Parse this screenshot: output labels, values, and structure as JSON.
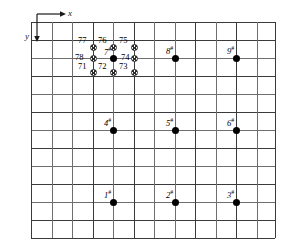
{
  "figure": {
    "width": 281,
    "height": 245,
    "background": "#ffffff",
    "grid_color": "#6e6e6e",
    "grid_major_color": "#3a3a3a",
    "marker_color": "#000000"
  },
  "axes": {
    "x_label": "x",
    "y_label": "y",
    "x_direction": "right",
    "y_direction": "down",
    "origin": {
      "x": 37,
      "y": 14
    }
  },
  "grid": {
    "x_lines": [
      31,
      52,
      72,
      93,
      113,
      134,
      154,
      175,
      195,
      216,
      236,
      257,
      275
    ],
    "y_lines": [
      22,
      40,
      58,
      76,
      94,
      112,
      130,
      148,
      166,
      184,
      202,
      220,
      238
    ],
    "x_major": [
      31,
      93,
      134,
      195,
      236,
      275
    ],
    "y_major": [
      22,
      40,
      76,
      112,
      148,
      184,
      220,
      238
    ]
  },
  "nodes": [
    {
      "id": "node-1",
      "label": "1",
      "mark": "#",
      "x": 113,
      "y": 202,
      "label_dx": -9,
      "label_dy": -13
    },
    {
      "id": "node-2",
      "label": "2",
      "mark": "#",
      "x": 175,
      "y": 202,
      "label_dx": -9,
      "label_dy": -13
    },
    {
      "id": "node-3",
      "label": "3",
      "mark": "#",
      "x": 236,
      "y": 202,
      "label_dx": -9,
      "label_dy": -13
    },
    {
      "id": "node-4",
      "label": "4",
      "mark": "#",
      "x": 113,
      "y": 130,
      "label_dx": -9,
      "label_dy": -13
    },
    {
      "id": "node-5",
      "label": "5",
      "mark": "#",
      "x": 175,
      "y": 130,
      "label_dx": -9,
      "label_dy": -13
    },
    {
      "id": "node-6",
      "label": "6",
      "mark": "#",
      "x": 236,
      "y": 130,
      "label_dx": -9,
      "label_dy": -13
    },
    {
      "id": "node-7",
      "label": "7",
      "mark": "#",
      "x": 113,
      "y": 58,
      "label_dx": -9,
      "label_dy": -12
    },
    {
      "id": "node-8",
      "label": "8",
      "mark": "#",
      "x": 175,
      "y": 58,
      "label_dx": -9,
      "label_dy": -13
    },
    {
      "id": "node-9",
      "label": "9",
      "mark": "#",
      "x": 236,
      "y": 58,
      "label_dx": -9,
      "label_dy": -13
    }
  ],
  "satellites": [
    {
      "id": "sat-77",
      "label": "77",
      "x": 93,
      "y": 47,
      "label_dx": -15,
      "label_dy": -11
    },
    {
      "id": "sat-76",
      "label": "76",
      "x": 113,
      "y": 47,
      "label_dx": -15,
      "label_dy": -11
    },
    {
      "id": "sat-75",
      "label": "75",
      "x": 134,
      "y": 47,
      "label_dx": -15,
      "label_dy": -11
    },
    {
      "id": "sat-78",
      "label": "78",
      "x": 93,
      "y": 58,
      "label_dx": -18,
      "label_dy": -5
    },
    {
      "id": "sat-74",
      "label": "74",
      "x": 134,
      "y": 58,
      "label_dx": -13,
      "label_dy": -5
    },
    {
      "id": "sat-71",
      "label": "71",
      "x": 93,
      "y": 72,
      "label_dx": -15,
      "label_dy": -10
    },
    {
      "id": "sat-72",
      "label": "72",
      "x": 113,
      "y": 72,
      "label_dx": -15,
      "label_dy": -10
    },
    {
      "id": "sat-73",
      "label": "73",
      "x": 134,
      "y": 72,
      "label_dx": -15,
      "label_dy": -10
    }
  ],
  "chart_data": {
    "type": "scatter",
    "xlabel": "x",
    "ylabel": "y",
    "grid": true,
    "legend": "none",
    "note": "Coordinates are in pixel space of the figure; y increases downward as indicated by the axis arrow.",
    "series": [
      {
        "name": "numbered-nodes",
        "marker": "filled-circle",
        "points": [
          {
            "label": "1#",
            "x": 113,
            "y": 202
          },
          {
            "label": "2#",
            "x": 175,
            "y": 202
          },
          {
            "label": "3#",
            "x": 236,
            "y": 202
          },
          {
            "label": "4#",
            "x": 113,
            "y": 130
          },
          {
            "label": "5#",
            "x": 175,
            "y": 130
          },
          {
            "label": "6#",
            "x": 236,
            "y": 130
          },
          {
            "label": "7#",
            "x": 113,
            "y": 58
          },
          {
            "label": "8#",
            "x": 175,
            "y": 58
          },
          {
            "label": "9#",
            "x": 236,
            "y": 58
          }
        ]
      },
      {
        "name": "satellite-points",
        "marker": "hatched-circle",
        "points": [
          {
            "label": "77",
            "x": 93,
            "y": 47
          },
          {
            "label": "76",
            "x": 113,
            "y": 47
          },
          {
            "label": "75",
            "x": 134,
            "y": 47
          },
          {
            "label": "78",
            "x": 93,
            "y": 58
          },
          {
            "label": "74",
            "x": 134,
            "y": 58
          },
          {
            "label": "71",
            "x": 93,
            "y": 72
          },
          {
            "label": "72",
            "x": 113,
            "y": 72
          },
          {
            "label": "73",
            "x": 134,
            "y": 72
          }
        ]
      }
    ]
  }
}
